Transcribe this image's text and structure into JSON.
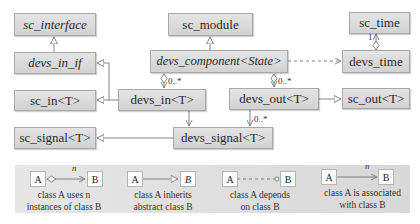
{
  "classes": {
    "sc_interface": "sc_interface",
    "devs_in_if": "devs_in_if",
    "sc_in": "sc_in<T>",
    "sc_signal": "sc_signal<T>",
    "sc_module": "sc_module",
    "devs_component": "devs_component<State>",
    "devs_in": "devs_in<T>",
    "devs_out": "devs_out<T>",
    "devs_signal": "devs_signal<T>",
    "sc_time": "sc_time",
    "devs_time": "devs_time",
    "sc_out": "sc_out<T>"
  },
  "multiplicities": {
    "component_to_in": "0..*",
    "component_to_out": "0..*",
    "out_to_signal": "0..*",
    "time_to_sctime": "1"
  },
  "legend": {
    "items": [
      {
        "a": "A",
        "b": "B",
        "n": "n",
        "caption_line1": "class A uses n",
        "caption_line2": "instances of class B"
      },
      {
        "a": "A",
        "b": "B",
        "n": "",
        "caption_line1": "class A inherits",
        "caption_line2": "abstract class B"
      },
      {
        "a": "A",
        "b": "B",
        "n": "",
        "caption_line1": "class A depends",
        "caption_line2": "on class B"
      },
      {
        "a": "A",
        "b": "B",
        "n": "n",
        "caption_line1": "class A is associated",
        "caption_line2": "with class B"
      }
    ]
  },
  "colors": {
    "box_fill": "#d9d9d9",
    "box_border": "#a8a8a8",
    "line": "#777777",
    "legend_bg": "#dedede"
  }
}
